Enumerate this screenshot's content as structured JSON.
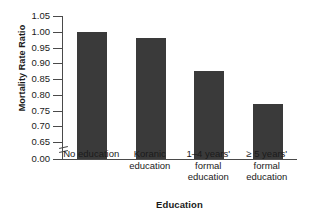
{
  "chart_data": {
    "type": "bar",
    "title": "",
    "categories": [
      "No education",
      "Koranic education",
      "1–4 years' formal education",
      "≥ 5 years' formal education"
    ],
    "category_lines": [
      [
        "No education"
      ],
      [
        "Koranic",
        "education"
      ],
      [
        "1–4 years'",
        "formal",
        "education"
      ],
      [
        "≥ 5 years'",
        "formal",
        "education"
      ]
    ],
    "values": [
      1.0,
      0.98,
      0.875,
      0.77
    ],
    "xlabel": "Education",
    "ylabel": "Mortality Rate Ratio",
    "ylim": [
      0.65,
      1.05
    ],
    "yticks": [
      "0.00",
      "0.65",
      "0.70",
      "0.75",
      "0.80",
      "0.85",
      "0.90",
      "0.95",
      "1.00",
      "1.05"
    ],
    "ytick_values": [
      0.0,
      0.65,
      0.7,
      0.75,
      0.8,
      0.85,
      0.9,
      0.95,
      1.0,
      1.05
    ],
    "axis_break": true,
    "grid": false,
    "legend": false,
    "bar_color": "#3a3a3a",
    "axis_color": "#4a4a4a",
    "background": "#ffffff"
  }
}
